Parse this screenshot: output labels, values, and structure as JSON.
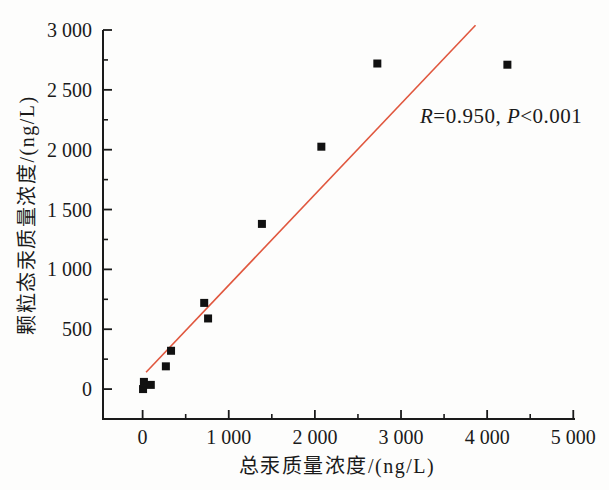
{
  "figure": {
    "background": "#fdfdfc",
    "axis_color": "#1a1a1a",
    "annotation_full_text": "R=0.950, P<0.001",
    "annotation_parts": [
      {
        "text": "R",
        "italic": true
      },
      {
        "text": "=0.950, ",
        "italic": false
      },
      {
        "text": "P",
        "italic": true
      },
      {
        "text": "<0.001",
        "italic": false
      }
    ]
  },
  "chart_data": {
    "type": "scatter",
    "title": "",
    "xlabel": "总汞质量浓度/(ng/L)",
    "ylabel": "颗粒态汞质量浓度/(ng/L)",
    "x_axis": {
      "min": -460,
      "max": 5020,
      "major_ticks": [
        {
          "value": 0,
          "label": "0"
        },
        {
          "value": 1000,
          "label": "1 000"
        },
        {
          "value": 2000,
          "label": "2 000"
        },
        {
          "value": 3000,
          "label": "3 000"
        },
        {
          "value": 4000,
          "label": "4 000"
        },
        {
          "value": 5000,
          "label": "5 000"
        }
      ],
      "minor_ticks": [
        500,
        1500,
        2500,
        3500,
        4500
      ],
      "grid": false
    },
    "y_axis": {
      "min": -250,
      "max": 3000,
      "major_ticks": [
        {
          "value": 0,
          "label": "0"
        },
        {
          "value": 500,
          "label": "500"
        },
        {
          "value": 1000,
          "label": "1 000"
        },
        {
          "value": 1500,
          "label": "1 500"
        },
        {
          "value": 2000,
          "label": "2 000"
        },
        {
          "value": 2500,
          "label": "2 500"
        },
        {
          "value": 3000,
          "label": "3 000"
        }
      ],
      "minor_ticks": [
        250,
        750,
        1250,
        1750,
        2250,
        2750
      ],
      "grid": false
    },
    "marker": {
      "shape": "square",
      "color": "#111111",
      "size_px": 8
    },
    "points": [
      {
        "x": 5,
        "y": 0
      },
      {
        "x": 15,
        "y": 60
      },
      {
        "x": 95,
        "y": 35
      },
      {
        "x": 270,
        "y": 190
      },
      {
        "x": 330,
        "y": 320
      },
      {
        "x": 715,
        "y": 720
      },
      {
        "x": 760,
        "y": 590
      },
      {
        "x": 1385,
        "y": 1380
      },
      {
        "x": 2075,
        "y": 2025
      },
      {
        "x": 2725,
        "y": 2720
      },
      {
        "x": 4235,
        "y": 2710
      }
    ],
    "regression_line": {
      "x1": 40,
      "y1": 140,
      "x2": 3865,
      "y2": 3040,
      "color": "#e0573e",
      "width_px": 1.6
    },
    "correlation": {
      "R": "0.950",
      "P": "<0.001"
    }
  }
}
